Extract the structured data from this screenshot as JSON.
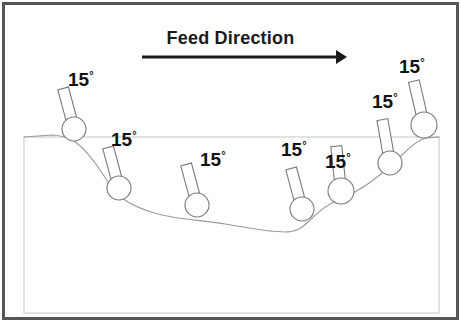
{
  "figure": {
    "width": 461,
    "height": 322,
    "background_color": "#ffffff",
    "outer_border_color": "#55555a",
    "inner_rect_color": "#cfcfcf",
    "web_line_color": "#8a8a8a",
    "roller_stroke_color": "#7a7a7a",
    "arrow_color": "#1a1a1a",
    "text_color": "#111111"
  },
  "feed_direction": {
    "label": "Feed Direction",
    "arrow_from_x": 142,
    "arrow_to_x": 347,
    "arrow_y": 57
  },
  "angle_labels": [
    {
      "text": "15",
      "degree_symbol": "°",
      "x": 68,
      "y": 70
    },
    {
      "text": "15",
      "degree_symbol": "°",
      "x": 111,
      "y": 130
    },
    {
      "text": "15",
      "degree_symbol": "°",
      "x": 200,
      "y": 150
    },
    {
      "text": "15",
      "degree_symbol": "°",
      "x": 281,
      "y": 140
    },
    {
      "text": "15",
      "degree_symbol": "°",
      "x": 325,
      "y": 152
    },
    {
      "text": "15",
      "degree_symbol": "°",
      "x": 372,
      "y": 92
    },
    {
      "text": "15",
      "degree_symbol": "°",
      "x": 399,
      "y": 57
    }
  ],
  "rollers": [
    {
      "id": "roller-1",
      "cx": 74,
      "cy": 129,
      "r": 12,
      "stem_angle_deg": -15,
      "stem_length": 42,
      "stem_width": 11
    },
    {
      "id": "roller-2",
      "cx": 119,
      "cy": 188,
      "r": 12,
      "stem_angle_deg": -15,
      "stem_length": 42,
      "stem_width": 11
    },
    {
      "id": "roller-3",
      "cx": 197,
      "cy": 205,
      "r": 12,
      "stem_angle_deg": -15,
      "stem_length": 42,
      "stem_width": 11
    },
    {
      "id": "roller-4",
      "cx": 302,
      "cy": 209,
      "r": 12,
      "stem_angle_deg": -15,
      "stem_length": 42,
      "stem_width": 11
    },
    {
      "id": "roller-5",
      "cx": 341,
      "cy": 191,
      "r": 13,
      "stem_angle_deg": -6,
      "stem_length": 45,
      "stem_width": 11
    },
    {
      "id": "roller-6",
      "cx": 390,
      "cy": 163,
      "r": 12,
      "stem_angle_deg": -10,
      "stem_length": 44,
      "stem_width": 11
    },
    {
      "id": "roller-7",
      "cx": 424,
      "cy": 125,
      "r": 13,
      "stem_angle_deg": -13,
      "stem_length": 45,
      "stem_width": 11
    }
  ],
  "inner_rect": {
    "x": 24,
    "y": 137,
    "width": 415,
    "height": 176
  },
  "web_path": "M 24 137 L 52 135 C 62 135 68 138 74 141 C 84 148 92 158 100 170 C 108 182 114 192 122 198 C 131 205 143 210 158 214 C 176 219 200 220 225 224 C 250 228 268 232 285 232 C 296 232 302 228 308 222 C 316 214 325 206 336 201 C 348 196 360 190 372 181 C 384 172 394 163 404 153 C 412 145 418 140 426 138 L 439 137",
  "chart_data": {
    "type": "diagram",
    "title": "Feed Direction",
    "annotations": [
      "15°",
      "15°",
      "15°",
      "15°",
      "15°",
      "15°",
      "15°"
    ],
    "roller_count": 7,
    "angle_value": 15,
    "angle_unit": "degrees"
  }
}
